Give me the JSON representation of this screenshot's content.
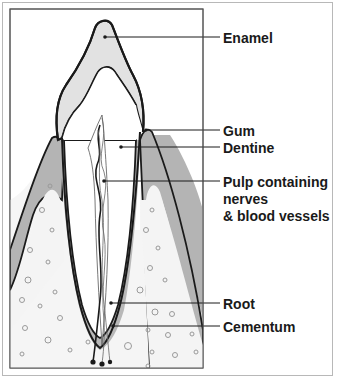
{
  "diagram": {
    "colors": {
      "enamel": "#e2e2e2",
      "gum": "#b4b4b4",
      "bone": "#f4f4f4",
      "outline": "#1a1a1a",
      "frame": "#b8b8b8"
    },
    "labels": {
      "enamel": "Enamel",
      "gum": "Gum",
      "dentine": "Dentine",
      "pulp_line1": "Pulp containing",
      "pulp_line2": "nerves",
      "pulp_line3": "& blood vessels",
      "root": "Root",
      "cementum": "Cementum"
    }
  }
}
